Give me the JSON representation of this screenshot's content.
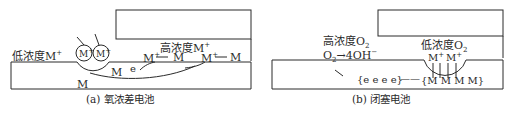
{
  "panel_a": {
    "caption": "(a) 氧浓差电池",
    "low_conc_label": "低浓度M",
    "low_conc_sup": "+",
    "high_conc_label": "高浓度M",
    "high_conc_sup": "+",
    "ion_1": "M",
    "ion_2": "M",
    "ion_sup": "+",
    "reaction_1_left": "M",
    "reaction_1_right": "M",
    "reaction_2_left": "M",
    "reaction_2_right": "M",
    "reaction_sup": "+",
    "electron": "e",
    "metal_1": "M",
    "metal_2": "M"
  },
  "panel_b": {
    "caption": "(b) 闭塞电池",
    "high_conc_label": "高浓度O",
    "high_conc_sub": "2",
    "reaction_left": "O",
    "reaction_sub": "2",
    "reaction_right": "→4OH",
    "reaction_sup": "−",
    "low_conc_label": "低浓度O",
    "low_conc_sub": "2",
    "ion_1": "M",
    "ion_2": "M",
    "ion_sup": "+",
    "electrons": "{e e e e}",
    "dash": "——",
    "metals": "{M M M M}"
  },
  "colors": {
    "line": "#2a2a2a",
    "background": "#ffffff"
  }
}
